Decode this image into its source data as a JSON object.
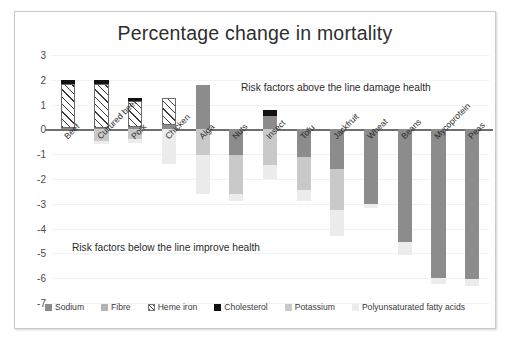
{
  "chart_data": {
    "type": "bar",
    "title": "Percentage change in mortality",
    "xlabel": "",
    "ylabel": "",
    "ylim": [
      -7,
      3
    ],
    "yticks": [
      3,
      2,
      1,
      0,
      -1,
      -2,
      -3,
      -4,
      -5,
      -6,
      -7
    ],
    "grid": false,
    "stacked": true,
    "legend_position": "bottom",
    "categories": [
      "Beef",
      "Cultured beef",
      "Pork",
      "Chicken",
      "Alga",
      "Nuts",
      "Insect",
      "Tofu",
      "Jackfruit",
      "Wheat",
      "Beans",
      "Mycoprotein",
      "Peas"
    ],
    "series": [
      {
        "name": "Sodium",
        "color": "#8c8c8c",
        "values": [
          0.07,
          0.07,
          0.1,
          0.18,
          1.8,
          -1.05,
          0.55,
          -1.1,
          -1.6,
          -3.0,
          -4.55,
          -6.0,
          -6.05
        ]
      },
      {
        "name": "Fibre",
        "color": "#b3b3b3",
        "values": [
          0,
          0,
          0,
          0,
          0,
          0,
          0,
          0,
          0,
          0,
          0,
          0,
          0
        ]
      },
      {
        "name": "Heme iron",
        "color": "hatched",
        "values": [
          1.78,
          1.78,
          1.05,
          1.07,
          0,
          0,
          0,
          0,
          0,
          0,
          0,
          0,
          0
        ]
      },
      {
        "name": "Cholesterol",
        "color": "#111111",
        "values": [
          0.16,
          0.16,
          0.13,
          0,
          0,
          0,
          0.22,
          0,
          0,
          0,
          0,
          0,
          0
        ]
      },
      {
        "name": "Potassium",
        "color": "#c9c9c9",
        "values": [
          0,
          -0.45,
          -0.4,
          0,
          -1.05,
          -1.55,
          -1.45,
          -1.35,
          -1.65,
          0,
          0,
          0,
          0
        ]
      },
      {
        "name": "Polyunsaturated fatty acids",
        "color": "#ececec",
        "values": [
          0,
          -0.15,
          -0.15,
          -1.4,
          -1.55,
          -0.3,
          -0.55,
          -0.45,
          -1.05,
          -0.15,
          -0.5,
          -0.25,
          -0.25
        ]
      }
    ],
    "annotations": [
      {
        "name": "above-line-note",
        "text": "Risk factors above the line damage health"
      },
      {
        "name": "below-line-note",
        "text": "Risk factors below the line improve  health"
      }
    ]
  },
  "legend": {
    "items": [
      {
        "label": "Sodium",
        "swatch": "sodium-swatch"
      },
      {
        "label": "Fibre",
        "swatch": "fibre-swatch"
      },
      {
        "label": "Heme iron",
        "swatch": "heme-iron-swatch"
      },
      {
        "label": "Cholesterol",
        "swatch": "cholesterol-swatch"
      },
      {
        "label": "Potassium",
        "swatch": "potassium-swatch"
      },
      {
        "label": "Polyunsaturated fatty acids",
        "swatch": "pufa-swatch"
      }
    ]
  }
}
